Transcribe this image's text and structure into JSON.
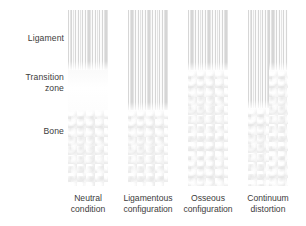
{
  "figure": {
    "background_color": "#ffffff",
    "row_labels": [
      {
        "id": "ligament",
        "text": "Ligament"
      },
      {
        "id": "transition",
        "text": "Transition\nzone"
      },
      {
        "id": "bone",
        "text": "Bone"
      }
    ],
    "columns": [
      {
        "id": "neutral-condition",
        "caption": "Neutral\ncondition",
        "description": "Striated ligament on top, smooth pale transition zone in the middle, trabecular bone below",
        "zones": [
          {
            "texture": "ligament",
            "top_px": 0,
            "height_px": 60
          },
          {
            "texture": "transition",
            "top_px": 60,
            "height_px": 40
          },
          {
            "texture": "bone",
            "top_px": 100,
            "height_px": 76
          }
        ]
      },
      {
        "id": "ligamentous-configuration",
        "caption": "Ligamentous\nconfiguration",
        "description": "Striated ligament texture extends down through the transition zone; bone begins lower",
        "zones": [
          {
            "texture": "ligament",
            "top_px": 0,
            "height_px": 100
          },
          {
            "texture": "bone",
            "top_px": 100,
            "height_px": 76
          }
        ]
      },
      {
        "id": "osseous-configuration",
        "caption": "Osseous\nconfiguration",
        "description": "Ligament ends high; trabecular bone texture occupies the transition zone",
        "zones": [
          {
            "texture": "ligament",
            "top_px": 0,
            "height_px": 60
          },
          {
            "texture": "bone",
            "top_px": 60,
            "height_px": 116
          }
        ]
      },
      {
        "id": "continuum-distortion",
        "caption": "Continuum\ndistortion",
        "description": "Asymmetric split: ligament striations run deep on the left half while bone encroaches high on the right half",
        "split": true,
        "zones_left": [
          {
            "texture": "ligament",
            "top_px": 0,
            "height_px": 98
          },
          {
            "texture": "bone",
            "top_px": 98,
            "height_px": 78
          }
        ],
        "zones_right": [
          {
            "texture": "ligament",
            "top_px": 0,
            "height_px": 60
          },
          {
            "texture": "bone",
            "top_px": 60,
            "height_px": 116
          }
        ]
      }
    ],
    "colors": {
      "text": "#3c3c3c",
      "ligament_stripe": "#d6d6d6",
      "transition_fill": "#fcfcfc",
      "bone_fill": "#f2f2f2",
      "background": "#ffffff"
    }
  }
}
